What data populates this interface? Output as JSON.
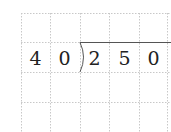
{
  "problem": {
    "type": "long-division",
    "divisor": [
      "4",
      "0"
    ],
    "dividend": [
      "2",
      "5",
      "0"
    ],
    "expression": "250 ÷ 40"
  },
  "grid": {
    "columns_x": [
      21,
      50,
      80,
      109,
      139,
      167
    ],
    "rows_y": [
      13,
      42,
      72,
      102,
      132
    ],
    "line_color": "#c8c8c8",
    "division_line_color": "#555555"
  }
}
